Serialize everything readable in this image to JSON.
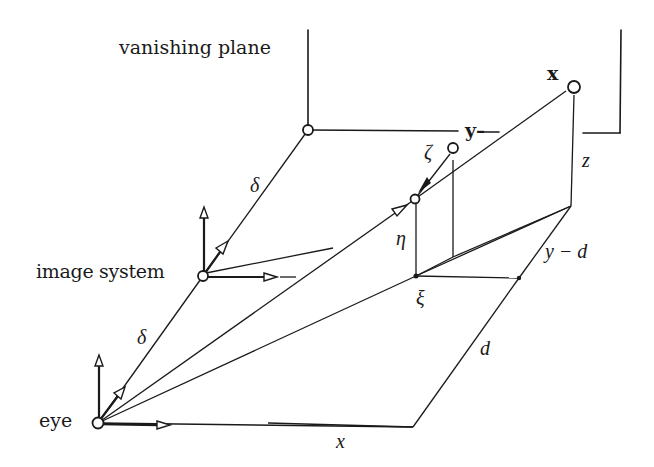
{
  "figure": {
    "type": "perspective-projection-geometry",
    "labels": {
      "vanishing_plane": "vanishing plane",
      "image_system": "image system",
      "eye": "eye",
      "point_X": "x",
      "axis_y": "y–",
      "zeta": "ζ",
      "eta": "η",
      "xi": "ξ",
      "z": "z",
      "y_minus_d": "y − d",
      "d": "d",
      "x": "x",
      "delta_upper": "δ",
      "delta_lower": "δ"
    },
    "colors": {
      "stroke": "#1a1a1a",
      "background": "#ffffff"
    }
  }
}
